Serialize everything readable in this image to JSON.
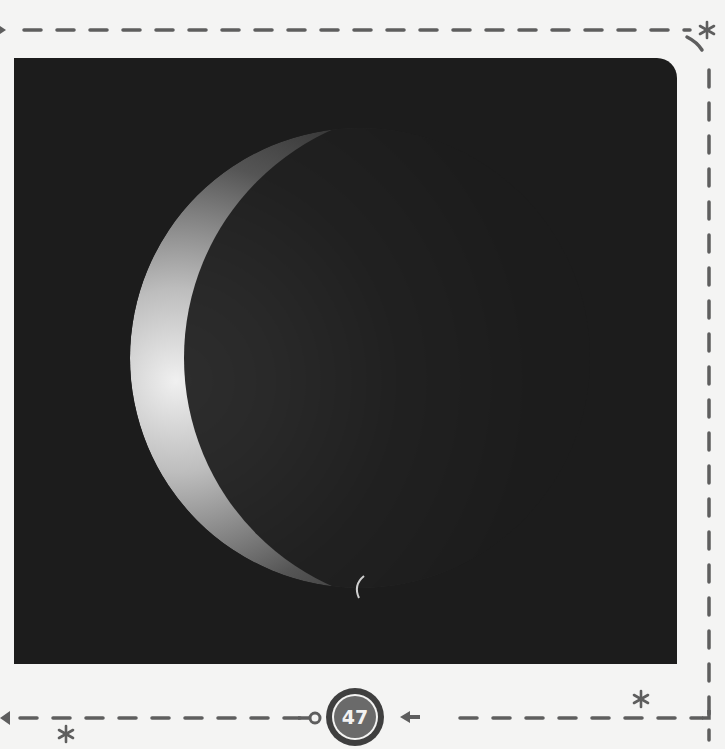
{
  "page": {
    "number": "47",
    "background": "#f4f4f3",
    "accent": "#5a5a5a"
  },
  "photo": {
    "subject": "crescent-planet-with-small-moon",
    "background": "#1c1c1c"
  },
  "decorations": {
    "stars": [
      "star-top-right",
      "star-bottom-right",
      "star-bottom-left"
    ],
    "arrows": [
      "arrow-left-edge",
      "arrow-pointing-to-badge"
    ]
  }
}
